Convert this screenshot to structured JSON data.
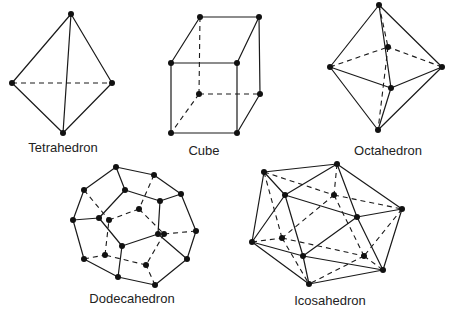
{
  "diagram": {
    "solids": [
      {
        "name": "Tetrahedron",
        "label": "Tetrahedron",
        "label_pos": [
          63,
          152
        ],
        "vertices": [
          [
            71,
            14
          ],
          [
            12,
            83
          ],
          [
            112,
            83
          ],
          [
            63,
            133
          ]
        ],
        "edges": [
          [
            0,
            1
          ],
          [
            0,
            2
          ],
          [
            0,
            3
          ],
          [
            1,
            3
          ],
          [
            2,
            3
          ]
        ],
        "hidden_edges": [
          [
            1,
            2
          ]
        ]
      },
      {
        "name": "Cube",
        "label": "Cube",
        "label_pos": [
          204,
          155
        ],
        "vertices": [
          [
            200,
            17
          ],
          [
            259,
            17
          ],
          [
            171,
            63
          ],
          [
            237,
            63
          ],
          [
            199,
            94
          ],
          [
            260,
            94
          ],
          [
            171,
            133
          ],
          [
            237,
            133
          ]
        ],
        "edges": [
          [
            0,
            1
          ],
          [
            0,
            2
          ],
          [
            1,
            3
          ],
          [
            2,
            3
          ],
          [
            2,
            6
          ],
          [
            3,
            7
          ],
          [
            6,
            7
          ],
          [
            1,
            5
          ],
          [
            5,
            7
          ]
        ],
        "hidden_edges": [
          [
            0,
            4
          ],
          [
            4,
            5
          ],
          [
            4,
            6
          ]
        ]
      },
      {
        "name": "Octahedron",
        "label": "Octahedron",
        "label_pos": [
          388,
          155
        ],
        "vertices": [
          [
            379,
            5
          ],
          [
            330,
            67
          ],
          [
            442,
            67
          ],
          [
            388,
            47
          ],
          [
            391,
            88
          ],
          [
            378,
            130
          ]
        ],
        "edges": [
          [
            0,
            1
          ],
          [
            0,
            2
          ],
          [
            0,
            4
          ],
          [
            1,
            4
          ],
          [
            2,
            4
          ],
          [
            1,
            5
          ],
          [
            2,
            5
          ],
          [
            4,
            5
          ]
        ],
        "hidden_edges": [
          [
            0,
            3
          ],
          [
            1,
            3
          ],
          [
            2,
            3
          ],
          [
            3,
            5
          ]
        ]
      },
      {
        "name": "Dodecahedron",
        "label": "Dodecahedron",
        "label_pos": [
          132,
          303
        ],
        "vertices": [
          [
            116,
            167
          ],
          [
            154,
            175
          ],
          [
            181,
            194
          ],
          [
            196,
            231
          ],
          [
            187,
            259
          ],
          [
            155,
            285
          ],
          [
            118,
            277
          ],
          [
            84,
            259
          ],
          [
            73,
            220
          ],
          [
            84,
            190
          ],
          [
            125,
            190
          ],
          [
            160,
            201
          ],
          [
            158,
            234
          ],
          [
            122,
            246
          ],
          [
            99,
            218
          ],
          [
            139,
            209
          ],
          [
            109,
            220
          ],
          [
            164,
            234
          ],
          [
            146,
            265
          ],
          [
            105,
            255
          ]
        ],
        "edges": [
          [
            0,
            1
          ],
          [
            1,
            2
          ],
          [
            2,
            3
          ],
          [
            3,
            4
          ],
          [
            4,
            5
          ],
          [
            5,
            6
          ],
          [
            6,
            7
          ],
          [
            7,
            8
          ],
          [
            8,
            9
          ],
          [
            9,
            0
          ],
          [
            0,
            10
          ],
          [
            2,
            11
          ],
          [
            4,
            12
          ],
          [
            6,
            13
          ],
          [
            8,
            14
          ],
          [
            10,
            11
          ],
          [
            11,
            12
          ],
          [
            12,
            13
          ],
          [
            13,
            14
          ],
          [
            14,
            10
          ]
        ],
        "hidden_edges": [
          [
            1,
            15
          ],
          [
            3,
            17
          ],
          [
            5,
            18
          ],
          [
            7,
            19
          ],
          [
            9,
            16
          ],
          [
            15,
            16
          ],
          [
            15,
            17
          ],
          [
            17,
            18
          ],
          [
            18,
            19
          ],
          [
            19,
            16
          ]
        ]
      },
      {
        "name": "Icosahedron",
        "label": "Icosahedron",
        "label_pos": [
          330,
          305
        ],
        "vertices": [
          [
            264,
            172
          ],
          [
            337,
            164
          ],
          [
            285,
            195
          ],
          [
            334,
            195
          ],
          [
            402,
            209
          ],
          [
            357,
            217
          ],
          [
            252,
            242
          ],
          [
            282,
            238
          ],
          [
            303,
            256
          ],
          [
            364,
            256
          ],
          [
            383,
            270
          ],
          [
            309,
            284
          ]
        ],
        "edges": [
          [
            0,
            1
          ],
          [
            0,
            2
          ],
          [
            1,
            2
          ],
          [
            1,
            5
          ],
          [
            1,
            4
          ],
          [
            2,
            5
          ],
          [
            4,
            5
          ],
          [
            0,
            6
          ],
          [
            2,
            6
          ],
          [
            2,
            8
          ],
          [
            5,
            8
          ],
          [
            6,
            8
          ],
          [
            4,
            10
          ],
          [
            5,
            10
          ],
          [
            8,
            10
          ],
          [
            6,
            11
          ],
          [
            8,
            11
          ],
          [
            10,
            11
          ]
        ],
        "hidden_edges": [
          [
            0,
            3
          ],
          [
            1,
            3
          ],
          [
            3,
            4
          ],
          [
            3,
            7
          ],
          [
            3,
            9
          ],
          [
            0,
            7
          ],
          [
            6,
            7
          ],
          [
            7,
            11
          ],
          [
            7,
            9
          ],
          [
            9,
            11
          ],
          [
            9,
            10
          ],
          [
            4,
            9
          ]
        ]
      }
    ]
  }
}
